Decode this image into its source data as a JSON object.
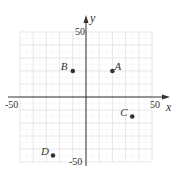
{
  "chart_data": {
    "type": "scatter",
    "title": "",
    "xlabel": "x",
    "ylabel": "y",
    "xlim": [
      -50,
      50
    ],
    "ylim": [
      -50,
      50
    ],
    "grid": true,
    "grid_major_step": 10,
    "grid_minor_step": 5,
    "x_tick_labels": [
      "-50",
      "50"
    ],
    "y_tick_labels": [
      "50",
      "-50"
    ],
    "points": [
      {
        "label": "A",
        "x": 20,
        "y": 20
      },
      {
        "label": "B",
        "x": -10,
        "y": 20
      },
      {
        "label": "C",
        "x": 35,
        "y": -15
      },
      {
        "label": "D",
        "x": -25,
        "y": -45
      }
    ],
    "point_color": "#333333",
    "grid_color": "#dddddd",
    "axis_color": "#333333"
  }
}
